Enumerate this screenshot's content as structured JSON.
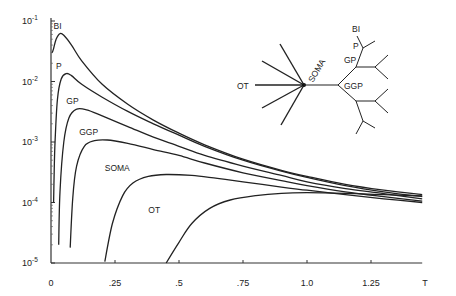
{
  "chart_data": {
    "type": "line",
    "title": "",
    "xlabel": "T",
    "ylabel": "",
    "yscale": "log",
    "xlim": [
      0,
      1.45
    ],
    "ylim": [
      1e-05,
      0.1
    ],
    "xticks": [
      {
        "v": 0,
        "label": "0"
      },
      {
        "v": 0.25,
        "label": ".25"
      },
      {
        "v": 0.5,
        "label": ".5"
      },
      {
        "v": 0.75,
        "label": ".75"
      },
      {
        "v": 1.0,
        "label": "1.0"
      },
      {
        "v": 1.25,
        "label": "1.25"
      }
    ],
    "yticks": [
      {
        "exp": -1,
        "label": "10",
        "sup": "-1"
      },
      {
        "exp": -2,
        "label": "10",
        "sup": "-2"
      },
      {
        "exp": -3,
        "label": "10",
        "sup": "-3"
      },
      {
        "exp": -4,
        "label": "10",
        "sup": "-4"
      },
      {
        "exp": -5,
        "label": "10",
        "sup": "-5"
      }
    ],
    "series": [
      {
        "name": "BI",
        "label_at": [
          0.01,
          0.075
        ],
        "points": [
          [
            0.005,
            0.03
          ],
          [
            0.01,
            0.035
          ],
          [
            0.02,
            0.05
          ],
          [
            0.035,
            0.062
          ],
          [
            0.05,
            0.058
          ],
          [
            0.08,
            0.04
          ],
          [
            0.12,
            0.022
          ],
          [
            0.2,
            0.009
          ],
          [
            0.3,
            0.0042
          ],
          [
            0.4,
            0.0023
          ],
          [
            0.5,
            0.0014
          ],
          [
            0.6,
            0.0009
          ],
          [
            0.75,
            0.00052
          ],
          [
            0.9,
            0.00034
          ],
          [
            1.0,
            0.00027
          ],
          [
            1.15,
            0.0002
          ],
          [
            1.3,
            0.00016
          ],
          [
            1.45,
            0.000135
          ]
        ]
      },
      {
        "name": "P",
        "label_at": [
          0.02,
          0.016
        ],
        "points": [
          [
            0.01,
            0.0001
          ],
          [
            0.015,
            0.0008
          ],
          [
            0.025,
            0.005
          ],
          [
            0.04,
            0.011
          ],
          [
            0.06,
            0.0135
          ],
          [
            0.08,
            0.0125
          ],
          [
            0.12,
            0.009
          ],
          [
            0.2,
            0.0055
          ],
          [
            0.3,
            0.0032
          ],
          [
            0.4,
            0.002
          ],
          [
            0.5,
            0.0013
          ],
          [
            0.6,
            0.00085
          ],
          [
            0.75,
            0.0005
          ],
          [
            0.9,
            0.00033
          ],
          [
            1.0,
            0.00026
          ],
          [
            1.15,
            0.00019
          ],
          [
            1.3,
            0.00015
          ],
          [
            1.45,
            0.000125
          ]
        ]
      },
      {
        "name": "GP",
        "label_at": [
          0.06,
          0.0042
        ],
        "points": [
          [
            0.03,
            2e-05
          ],
          [
            0.035,
            0.00015
          ],
          [
            0.05,
            0.001
          ],
          [
            0.07,
            0.0025
          ],
          [
            0.1,
            0.0035
          ],
          [
            0.14,
            0.0034
          ],
          [
            0.2,
            0.0027
          ],
          [
            0.3,
            0.0018
          ],
          [
            0.4,
            0.0012
          ],
          [
            0.5,
            0.00085
          ],
          [
            0.6,
            0.0006
          ],
          [
            0.75,
            0.0004
          ],
          [
            0.9,
            0.00028
          ],
          [
            1.0,
            0.00022
          ],
          [
            1.15,
            0.00017
          ],
          [
            1.3,
            0.00014
          ],
          [
            1.45,
            0.000115
          ]
        ]
      },
      {
        "name": "GGP",
        "label_at": [
          0.11,
          0.0013
        ],
        "points": [
          [
            0.075,
            1.8e-05
          ],
          [
            0.085,
            0.00012
          ],
          [
            0.1,
            0.0004
          ],
          [
            0.13,
            0.00085
          ],
          [
            0.17,
            0.00105
          ],
          [
            0.22,
            0.00108
          ],
          [
            0.3,
            0.00095
          ],
          [
            0.4,
            0.00075
          ],
          [
            0.5,
            0.0006
          ],
          [
            0.6,
            0.00045
          ],
          [
            0.75,
            0.00031
          ],
          [
            0.9,
            0.00023
          ],
          [
            1.0,
            0.00019
          ],
          [
            1.15,
            0.00015
          ],
          [
            1.3,
            0.000125
          ],
          [
            1.45,
            0.000105
          ]
        ]
      },
      {
        "name": "SOMA",
        "label_at": [
          0.21,
          0.00033
        ],
        "points": [
          [
            0.21,
            1.05e-05
          ],
          [
            0.24,
            4.5e-05
          ],
          [
            0.28,
            0.00013
          ],
          [
            0.32,
            0.00021
          ],
          [
            0.38,
            0.00027
          ],
          [
            0.45,
            0.00029
          ],
          [
            0.55,
            0.00028
          ],
          [
            0.65,
            0.00025
          ],
          [
            0.75,
            0.00022
          ],
          [
            0.9,
            0.00018
          ],
          [
            1.0,
            0.00016
          ],
          [
            1.15,
            0.000135
          ],
          [
            1.3,
            0.000115
          ],
          [
            1.45,
            0.0001
          ]
        ]
      },
      {
        "name": "OT",
        "label_at": [
          0.38,
          6.6e-05
        ],
        "points": [
          [
            0.45,
            1e-05
          ],
          [
            0.5,
            2.2e-05
          ],
          [
            0.55,
            4.5e-05
          ],
          [
            0.62,
            8e-05
          ],
          [
            0.7,
            0.00011
          ],
          [
            0.8,
            0.00013
          ],
          [
            0.9,
            0.000142
          ],
          [
            1.0,
            0.000145
          ],
          [
            1.15,
            0.000142
          ],
          [
            1.3,
            0.000135
          ],
          [
            1.45,
            0.000128
          ]
        ]
      }
    ],
    "inset": {
      "description": "neuron tree schematic",
      "labels": [
        "BI",
        "P",
        "GP",
        "GGP",
        "SOMA",
        "OT"
      ]
    },
    "grid": false,
    "legend": "none"
  }
}
